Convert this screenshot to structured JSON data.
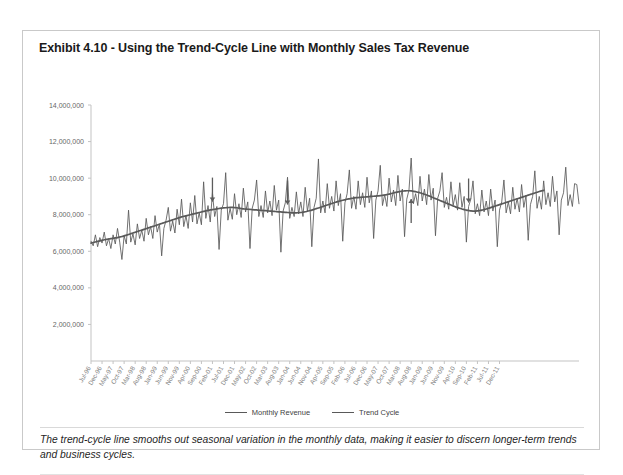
{
  "exhibit": {
    "title": "Exhibit 4.10 - Using the Trend-Cycle Line with Monthly Sales Tax Revenue",
    "caption": "The trend-cycle line smooths out seasonal variation in the monthly data, making it easier to discern longer-term trends and business cycles."
  },
  "colors": {
    "series_line": "#595959",
    "axis": "#c3c3c3",
    "tick_label": "#7a7a7a",
    "frame_border": "#c9c9c9",
    "title_text": "#1a1a1a",
    "annotation": "#5c5c5c"
  },
  "legend": {
    "position": "bottom-center",
    "entries": [
      {
        "label": "Monthly Revenue",
        "color": "#595959"
      },
      {
        "label": "Trend Cycle",
        "color": "#595959"
      }
    ]
  },
  "chart_data": {
    "type": "line",
    "title": "Exhibit 4.10 - Using the Trend-Cycle Line with Monthly Sales Tax Revenue",
    "xlabel": "",
    "ylabel": "",
    "grid": false,
    "legend_position": "bottom-center",
    "ylim": [
      0,
      14000000
    ],
    "ytick_labels": [
      "2,000,000",
      "4,000,000",
      "6,000,000",
      "8,000,000",
      "10,000,000",
      "12,000,000",
      "14,000,000"
    ],
    "ytick_values": [
      2000000,
      4000000,
      6000000,
      8000000,
      10000000,
      12000000,
      14000000
    ],
    "x_start": "Jul-96",
    "x_end": "Dec-11",
    "x_tick_interval_months": 5,
    "xtick_labels": [
      "Jul-96",
      "Dec-96",
      "May-97",
      "Oct-97",
      "Mar-98",
      "Aug-98",
      "Jan-99",
      "Jun-99",
      "Nov-99",
      "Apr-00",
      "Sep-00",
      "Feb-01",
      "Jul-01",
      "Dec-01",
      "May-02",
      "Oct-02",
      "Mar-03",
      "Aug-03",
      "Jan-04",
      "Jun-04",
      "Nov-04",
      "Apr-05",
      "Sep-05",
      "Feb-06",
      "Jul-06",
      "Dec-06",
      "May-07",
      "Oct-07",
      "Mar-08",
      "Aug-08",
      "Jan-09",
      "Jun-09",
      "Nov-09",
      "Apr-10",
      "Sep-10",
      "Feb-11",
      "Jul-11",
      "Dec-11"
    ],
    "series": [
      {
        "name": "Monthly Revenue",
        "color": "#595959",
        "values": [
          6550000,
          6300000,
          6900000,
          6250000,
          6750000,
          6450000,
          7050000,
          6300000,
          6700000,
          6150000,
          6900000,
          6400000,
          7250000,
          6500000,
          5550000,
          6850000,
          6400000,
          8250000,
          6500000,
          6950000,
          6350000,
          7500000,
          6700000,
          7150000,
          6550000,
          7800000,
          6900000,
          7350000,
          6700000,
          7950000,
          7050000,
          7500000,
          5750000,
          7250000,
          7700000,
          8400000,
          7100000,
          7650000,
          7000000,
          8300000,
          7450000,
          8850000,
          7350000,
          7950000,
          7250000,
          8650000,
          7600000,
          9050000,
          7500000,
          8100000,
          7450000,
          9800000,
          7800000,
          8500000,
          7600000,
          9200000,
          7900000,
          8450000,
          6100000,
          8250000,
          8600000,
          10300000,
          7700000,
          8350000,
          7750000,
          9150000,
          8000000,
          8600000,
          7850000,
          9450000,
          8150000,
          8700000,
          6150000,
          8350000,
          8800000,
          9900000,
          7900000,
          8500000,
          7850000,
          9300000,
          8100000,
          8750000,
          7950000,
          9600000,
          8250000,
          8800000,
          5950000,
          8200000,
          8650000,
          10050000,
          7800000,
          8400000,
          7900000,
          9250000,
          8050000,
          8700000,
          7900000,
          9500000,
          8200000,
          8900000,
          6250000,
          8400000,
          8900000,
          11050000,
          8100000,
          8750000,
          8100000,
          9700000,
          8350000,
          9000000,
          8200000,
          9850000,
          8500000,
          9150000,
          6550000,
          8650000,
          9150000,
          10450000,
          8350000,
          9000000,
          8300000,
          9850000,
          8550000,
          9200000,
          8400000,
          10050000,
          8650000,
          9300000,
          6700000,
          8800000,
          9300000,
          10700000,
          8500000,
          9100000,
          8450000,
          10000000,
          8700000,
          9350000,
          8500000,
          10150000,
          8750000,
          9400000,
          6800000,
          8850000,
          9350000,
          11100000,
          8600000,
          9150000,
          8500000,
          10100000,
          8750000,
          9400000,
          8550000,
          10200000,
          8800000,
          9450000,
          6850000,
          8900000,
          9300000,
          10300000,
          8400000,
          8950000,
          8300000,
          9800000,
          8500000,
          9100000,
          8250000,
          9750000,
          8400000,
          9000000,
          6500000,
          8450000,
          8850000,
          9850000,
          8050000,
          8600000,
          7950000,
          9350000,
          8150000,
          8750000,
          7950000,
          9400000,
          8200000,
          8800000,
          6250000,
          8250000,
          8700000,
          9900000,
          8100000,
          8700000,
          8050000,
          9500000,
          8300000,
          8900000,
          8150000,
          9650000,
          8400000,
          9050000,
          6600000,
          8550000,
          9000000,
          10400000,
          8350000,
          9000000,
          8300000,
          9850000,
          8550000,
          9200000,
          8450000,
          10100000,
          8700000,
          9300000,
          6900000,
          8800000,
          9200000,
          10600000,
          8500000,
          9100000,
          8450000,
          9700000,
          9650000,
          8600000
        ]
      },
      {
        "name": "Trend Cycle",
        "color": "#595959",
        "values": [
          6450000,
          6480000,
          6510000,
          6540000,
          6570000,
          6600000,
          6630000,
          6650000,
          6670000,
          6690000,
          6710000,
          6730000,
          6750000,
          6780000,
          6810000,
          6840000,
          6880000,
          6920000,
          6960000,
          7000000,
          7040000,
          7080000,
          7120000,
          7160000,
          7200000,
          7240000,
          7280000,
          7320000,
          7360000,
          7400000,
          7440000,
          7480000,
          7520000,
          7560000,
          7600000,
          7640000,
          7680000,
          7720000,
          7760000,
          7800000,
          7840000,
          7880000,
          7910000,
          7940000,
          7970000,
          8000000,
          8030000,
          8060000,
          8090000,
          8120000,
          8150000,
          8180000,
          8210000,
          8240000,
          8260000,
          8280000,
          8300000,
          8320000,
          8340000,
          8360000,
          8370000,
          8380000,
          8390000,
          8400000,
          8400000,
          8390000,
          8380000,
          8360000,
          8340000,
          8320000,
          8310000,
          8300000,
          8290000,
          8280000,
          8270000,
          8260000,
          8250000,
          8240000,
          8230000,
          8220000,
          8210000,
          8200000,
          8190000,
          8180000,
          8170000,
          8160000,
          8150000,
          8140000,
          8130000,
          8120000,
          8110000,
          8100000,
          8100000,
          8100000,
          8110000,
          8120000,
          8140000,
          8160000,
          8190000,
          8220000,
          8250000,
          8290000,
          8330000,
          8370000,
          8410000,
          8450000,
          8490000,
          8530000,
          8570000,
          8610000,
          8650000,
          8690000,
          8730000,
          8760000,
          8790000,
          8820000,
          8850000,
          8870000,
          8890000,
          8910000,
          8930000,
          8940000,
          8950000,
          8960000,
          8970000,
          8980000,
          8990000,
          9000000,
          9010000,
          9020000,
          9030000,
          9040000,
          9060000,
          9080000,
          9100000,
          9130000,
          9160000,
          9190000,
          9220000,
          9250000,
          9270000,
          9290000,
          9300000,
          9310000,
          9310000,
          9300000,
          9280000,
          9260000,
          9230000,
          9200000,
          9160000,
          9120000,
          9080000,
          9030000,
          8980000,
          8930000,
          8880000,
          8830000,
          8780000,
          8730000,
          8680000,
          8630000,
          8580000,
          8530000,
          8480000,
          8430000,
          8390000,
          8350000,
          8310000,
          8280000,
          8250000,
          8230000,
          8210000,
          8200000,
          8200000,
          8210000,
          8230000,
          8250000,
          8280000,
          8310000,
          8350000,
          8390000,
          8430000,
          8470000,
          8510000,
          8550000,
          8590000,
          8630000,
          8670000,
          8710000,
          8750000,
          8790000,
          8830000,
          8870000,
          8910000,
          8950000,
          8990000,
          9030000,
          9070000,
          9110000,
          9150000,
          9190000,
          9230000,
          9270000,
          9300000,
          9330000
        ]
      }
    ],
    "annotations": [
      {
        "name": "trend-dip-marker-1",
        "direction": "down",
        "x_index": 55
      },
      {
        "name": "trend-dip-marker-2",
        "direction": "down",
        "x_index": 89
      },
      {
        "name": "trend-rise-marker-1",
        "direction": "up",
        "x_index": 145
      },
      {
        "name": "trend-dip-marker-3",
        "direction": "down",
        "x_index": 171
      }
    ]
  }
}
